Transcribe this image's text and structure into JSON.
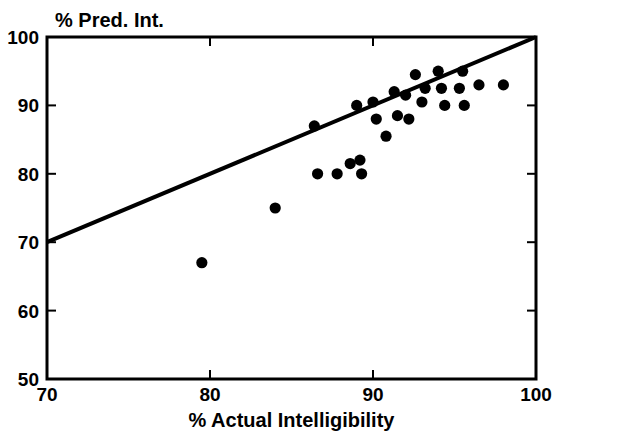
{
  "chart_data": {
    "type": "scatter",
    "title": "",
    "ylabel": "% Pred. Int.",
    "xlabel": "% Actual Intelligibility",
    "xlim": [
      70,
      100
    ],
    "ylim": [
      50,
      100
    ],
    "xticks": [
      70,
      80,
      90,
      100
    ],
    "yticks": [
      50,
      60,
      70,
      80,
      90,
      100
    ],
    "xtick_labels": [
      "70",
      "80",
      "90",
      "100"
    ],
    "ytick_labels": [
      "50",
      "60",
      "70",
      "80",
      "90",
      "100"
    ],
    "grid": false,
    "legend": "none",
    "marker": "filled-circle",
    "marker_color": "#000000",
    "series": [
      {
        "name": "observations",
        "points": [
          [
            79.5,
            67.0
          ],
          [
            84.0,
            75.0
          ],
          [
            86.4,
            87.0
          ],
          [
            86.6,
            80.0
          ],
          [
            87.8,
            80.0
          ],
          [
            88.6,
            81.5
          ],
          [
            89.0,
            90.0
          ],
          [
            89.2,
            82.0
          ],
          [
            89.3,
            80.0
          ],
          [
            90.0,
            90.5
          ],
          [
            90.2,
            88.0
          ],
          [
            90.8,
            85.5
          ],
          [
            91.3,
            92.0
          ],
          [
            91.5,
            88.5
          ],
          [
            92.0,
            91.5
          ],
          [
            92.2,
            88.0
          ],
          [
            92.6,
            94.5
          ],
          [
            93.0,
            90.5
          ],
          [
            93.2,
            92.5
          ],
          [
            94.0,
            95.0
          ],
          [
            94.2,
            92.5
          ],
          [
            94.4,
            90.0
          ],
          [
            95.3,
            92.5
          ],
          [
            95.5,
            95.0
          ],
          [
            95.6,
            90.0
          ],
          [
            96.5,
            93.0
          ],
          [
            98.0,
            93.0
          ]
        ]
      }
    ],
    "reference_line": {
      "name": "identity-line",
      "x_start": 70,
      "y_start": 70,
      "x_end": 100,
      "y_end": 100,
      "color": "#000000"
    }
  }
}
